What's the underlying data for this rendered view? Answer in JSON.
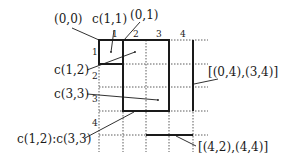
{
  "diagram": {
    "type": "grid-cell-range-notation",
    "column_indices": [
      "1",
      "2",
      "3",
      "4"
    ],
    "row_indices": [
      "1",
      "2",
      "3",
      "4"
    ],
    "labels": {
      "corner_00": "(0,0)",
      "cell_11": "c(1,1)",
      "corner_01": "(0,1)",
      "cell_12": "c(1,2)",
      "cell_33": "c(3,3)",
      "range_12_33": "c(1,2):c(3,3)",
      "edge_vertical": "[(0,4),(3,4)]",
      "edge_horizontal": "[(4,2),(4,4)]"
    },
    "colors": {
      "line": "#1a1a1a",
      "background": "#ffffff"
    }
  }
}
